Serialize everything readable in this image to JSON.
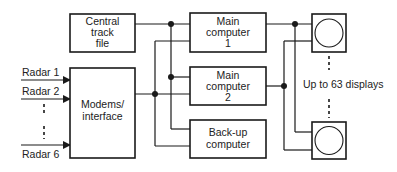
{
  "diagram": {
    "title": "",
    "boxes": {
      "central_track_file": [
        "Central",
        "track",
        "file"
      ],
      "main_computer_1": [
        "Main",
        "computer",
        "1"
      ],
      "main_computer_2": [
        "Main",
        "computer",
        "2"
      ],
      "backup_computer": [
        "Back-up",
        "computer"
      ],
      "modems_interface": [
        "Modems/",
        "interface"
      ]
    },
    "inputs": {
      "radar_1": "Radar 1",
      "radar_2": "Radar 2",
      "radar_6": "Radar 6"
    },
    "displays_label": "Up to 63 displays",
    "colors": {
      "line": "#1a1a1a",
      "background": "#ffffff",
      "text": "#222222"
    }
  }
}
